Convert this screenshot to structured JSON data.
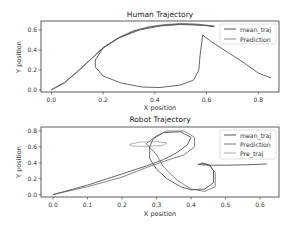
{
  "chart_data": [
    {
      "type": "line",
      "title": "Human Trajectory",
      "xlabel": "X position",
      "ylabel": "Y position",
      "xlim": [
        -0.04,
        0.88
      ],
      "ylim": [
        -0.02,
        0.69
      ],
      "xticks": [
        0.0,
        0.2,
        0.4,
        0.6,
        0.8
      ],
      "xtick_labels": [
        "0.0",
        "0.2",
        "0.4",
        "0.6",
        "0.8"
      ],
      "yticks": [
        0.0,
        0.2,
        0.4,
        0.6
      ],
      "ytick_labels": [
        "0.0",
        "0.2",
        "0.4",
        "0.6"
      ],
      "grid": false,
      "legend_position": "upper right",
      "series": [
        {
          "name": "mean_traj",
          "color": "#555555",
          "points": [
            [
              0.0,
              0.0
            ],
            [
              0.05,
              0.07
            ],
            [
              0.1,
              0.18
            ],
            [
              0.15,
              0.3
            ],
            [
              0.2,
              0.42
            ],
            [
              0.26,
              0.52
            ],
            [
              0.32,
              0.59
            ],
            [
              0.38,
              0.63
            ],
            [
              0.44,
              0.65
            ],
            [
              0.5,
              0.66
            ],
            [
              0.56,
              0.655
            ],
            [
              0.63,
              0.635
            ],
            [
              0.6,
              0.645
            ],
            [
              0.5,
              0.655
            ],
            [
              0.42,
              0.64
            ],
            [
              0.34,
              0.6
            ],
            [
              0.26,
              0.52
            ],
            [
              0.2,
              0.42
            ],
            [
              0.17,
              0.3
            ],
            [
              0.17,
              0.23
            ],
            [
              0.2,
              0.14
            ],
            [
              0.27,
              0.07
            ],
            [
              0.35,
              0.03
            ],
            [
              0.42,
              0.025
            ],
            [
              0.5,
              0.05
            ],
            [
              0.55,
              0.1
            ],
            [
              0.57,
              0.2
            ],
            [
              0.575,
              0.35
            ],
            [
              0.585,
              0.55
            ],
            [
              0.62,
              0.48
            ],
            [
              0.68,
              0.38
            ],
            [
              0.74,
              0.28
            ],
            [
              0.8,
              0.17
            ],
            [
              0.85,
              0.12
            ]
          ]
        },
        {
          "name": "Prediction",
          "color": "#888888",
          "points": [
            [
              0.0,
              0.005
            ],
            [
              0.05,
              0.075
            ],
            [
              0.1,
              0.185
            ],
            [
              0.15,
              0.305
            ],
            [
              0.2,
              0.425
            ],
            [
              0.26,
              0.525
            ],
            [
              0.32,
              0.595
            ],
            [
              0.38,
              0.635
            ],
            [
              0.44,
              0.655
            ],
            [
              0.5,
              0.665
            ],
            [
              0.56,
              0.66
            ],
            [
              0.63,
              0.64
            ]
          ]
        }
      ]
    },
    {
      "type": "line",
      "title": "Robot Trajectory",
      "xlabel": "X position",
      "ylabel": "Y position",
      "xlim": [
        -0.035,
        0.655
      ],
      "ylim": [
        -0.03,
        0.85
      ],
      "xticks": [
        0.0,
        0.1,
        0.2,
        0.3,
        0.4,
        0.5,
        0.6
      ],
      "xtick_labels": [
        "0.0",
        "0.1",
        "0.2",
        "0.3",
        "0.4",
        "0.5",
        "0.6"
      ],
      "yticks": [
        0.0,
        0.2,
        0.4,
        0.6,
        0.8
      ],
      "ytick_labels": [
        "0.0",
        "0.2",
        "0.4",
        "0.6",
        "0.8"
      ],
      "grid": false,
      "legend_position": "upper right",
      "series": [
        {
          "name": "mean_traj",
          "color": "#555555",
          "points": [
            [
              0.0,
              0.0
            ],
            [
              0.1,
              0.12
            ],
            [
              0.2,
              0.26
            ],
            [
              0.27,
              0.36
            ],
            [
              0.32,
              0.44
            ],
            [
              0.36,
              0.53
            ],
            [
              0.39,
              0.63
            ],
            [
              0.4,
              0.72
            ],
            [
              0.37,
              0.79
            ],
            [
              0.32,
              0.78
            ],
            [
              0.29,
              0.7
            ],
            [
              0.28,
              0.6
            ],
            [
              0.28,
              0.45
            ],
            [
              0.3,
              0.32
            ],
            [
              0.33,
              0.2
            ],
            [
              0.37,
              0.1
            ],
            [
              0.4,
              0.06
            ],
            [
              0.44,
              0.07
            ],
            [
              0.465,
              0.15
            ],
            [
              0.465,
              0.3
            ],
            [
              0.455,
              0.37
            ],
            [
              0.43,
              0.39
            ],
            [
              0.42,
              0.38
            ],
            [
              0.45,
              0.37
            ],
            [
              0.5,
              0.37
            ],
            [
              0.56,
              0.375
            ],
            [
              0.62,
              0.385
            ]
          ]
        },
        {
          "name": "Prediction",
          "color": "#777777",
          "points": [
            [
              0.0,
              0.0
            ],
            [
              0.1,
              0.1
            ],
            [
              0.2,
              0.22
            ],
            [
              0.27,
              0.34
            ],
            [
              0.33,
              0.43
            ],
            [
              0.38,
              0.5
            ],
            [
              0.41,
              0.6
            ],
            [
              0.41,
              0.72
            ],
            [
              0.38,
              0.8
            ],
            [
              0.33,
              0.8
            ],
            [
              0.3,
              0.74
            ],
            [
              0.27,
              0.64
            ],
            [
              0.3,
              0.5
            ],
            [
              0.32,
              0.35
            ],
            [
              0.36,
              0.18
            ],
            [
              0.4,
              0.07
            ],
            [
              0.44,
              0.04
            ],
            [
              0.47,
              0.1
            ],
            [
              0.47,
              0.28
            ],
            [
              0.45,
              0.38
            ],
            [
              0.43,
              0.4
            ]
          ]
        },
        {
          "name": "Pre_traj",
          "color": "#aaaaaa",
          "points": [
            [
              0.22,
              0.63
            ],
            [
              0.25,
              0.66
            ],
            [
              0.3,
              0.665
            ],
            [
              0.33,
              0.65
            ],
            [
              0.32,
              0.62
            ],
            [
              0.27,
              0.605
            ],
            [
              0.23,
              0.61
            ],
            [
              0.22,
              0.63
            ]
          ]
        }
      ]
    }
  ]
}
